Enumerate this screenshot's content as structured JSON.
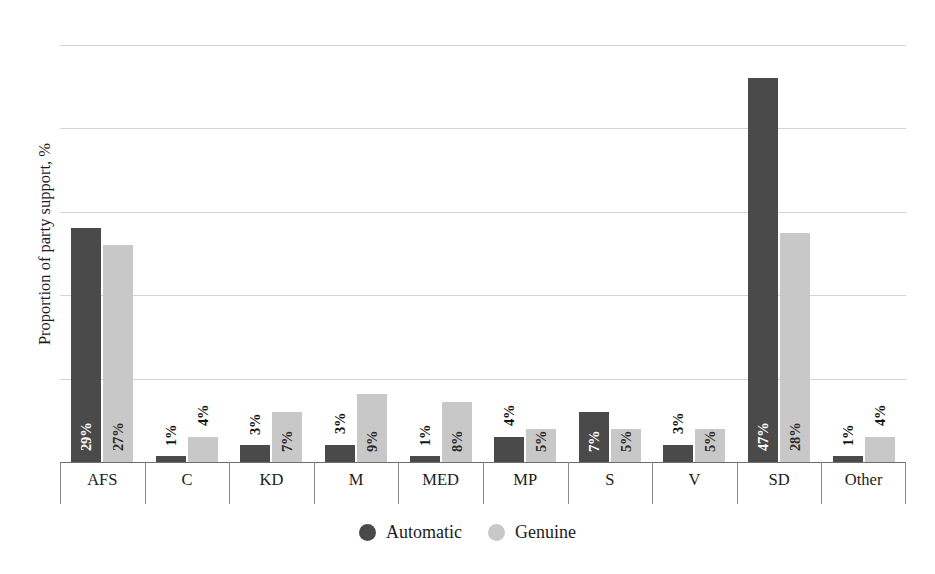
{
  "chart_data": {
    "type": "bar",
    "title": "",
    "subtitle": "",
    "xlabel": "",
    "ylabel": "Proportion of party support, %",
    "ylim": [
      0,
      50
    ],
    "ytick_values": [
      0,
      10,
      20,
      30,
      40,
      50
    ],
    "ytick_labels": [
      "0",
      "10",
      "20",
      "30",
      "40",
      "50"
    ],
    "grid": true,
    "legend_position": "bottom",
    "categories": [
      "AFS",
      "C",
      "KD",
      "M",
      "MED",
      "MP",
      "S",
      "V",
      "SD",
      "Other"
    ],
    "series": [
      {
        "name": "Automatic",
        "color": "#4a4a4a",
        "values": [
          28.0,
          0.7,
          2.0,
          2.1,
          0.7,
          3.0,
          6.0,
          2.1,
          46.0,
          0.7
        ],
        "labels": [
          "29%",
          "1%",
          "3%",
          "3%",
          "1%",
          "4%",
          "7%",
          "3%",
          "47%",
          "1%"
        ]
      },
      {
        "name": "Genuine",
        "color": "#c8c8c8",
        "values": [
          26.0,
          3.0,
          6.0,
          8.1,
          7.2,
          4.0,
          4.0,
          4.0,
          27.4,
          3.0
        ],
        "labels": [
          "27%",
          "4%",
          "7%",
          "9%",
          "8%",
          "5%",
          "5%",
          "5%",
          "28%",
          "4%"
        ]
      }
    ]
  },
  "axis": {
    "y_title": "Proportion of party support, %",
    "ticks": [
      "50",
      "40",
      "30",
      "20",
      "10",
      "0"
    ]
  },
  "categories": [
    {
      "label": "AFS"
    },
    {
      "label": "C"
    },
    {
      "label": "KD"
    },
    {
      "label": "M"
    },
    {
      "label": "MED"
    },
    {
      "label": "MP"
    },
    {
      "label": "S"
    },
    {
      "label": "V"
    },
    {
      "label": "SD"
    },
    {
      "label": "Other"
    }
  ],
  "legend": {
    "items": [
      {
        "label": "Automatic",
        "color": "#4a4a4a",
        "marker": "filled-circle-icon"
      },
      {
        "label": "Genuine",
        "color": "#c8c8c8",
        "marker": "filled-circle-icon"
      }
    ]
  },
  "caption_remnant": ""
}
